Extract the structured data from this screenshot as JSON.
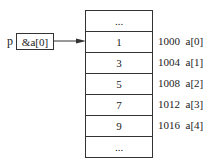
{
  "pointer": {
    "name": "p",
    "value": "&a[0]"
  },
  "cells": [
    {
      "value": "...",
      "address": "",
      "label": ""
    },
    {
      "value": "1",
      "address": "1000",
      "label": "a[0]"
    },
    {
      "value": "3",
      "address": "1004",
      "label": "a[1]"
    },
    {
      "value": "5",
      "address": "1008",
      "label": "a[2]"
    },
    {
      "value": "7",
      "address": "1012",
      "label": "a[3]"
    },
    {
      "value": "9",
      "address": "1016",
      "label": "a[4]"
    },
    {
      "value": "...",
      "address": "",
      "label": ""
    }
  ]
}
